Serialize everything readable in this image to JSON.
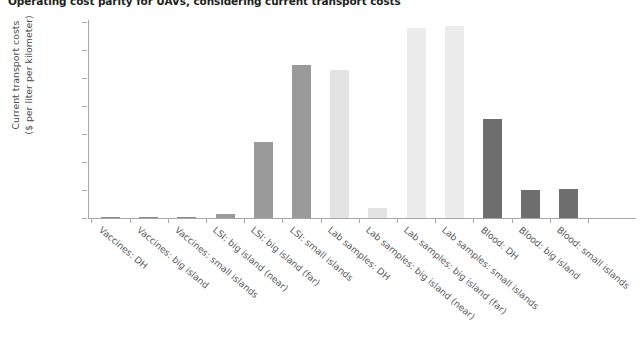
{
  "chart_data": {
    "type": "bar",
    "title": "Operating cost parity for UAVs, considering current transport costs",
    "xlabel": "",
    "ylabel_line1": "Current transport costs",
    "ylabel_line2": "($ per liter per kilometer)",
    "ylim": [
      0,
      0.7
    ],
    "ytick_labels": [
      "0.70",
      "0.60",
      "0.50",
      "0.40",
      "0.30",
      "0.20",
      "0.10",
      "0"
    ],
    "ytick_values": [
      0.7,
      0.6,
      0.5,
      0.4,
      0.3,
      0.2,
      0.1,
      0
    ],
    "grid": false,
    "legend": "none",
    "categories": [
      "Vaccines: DH",
      "Vaccines: big island",
      "Vaccines: small islands",
      "LSI: big island (near)",
      "LSI: big island (far)",
      "LSI: small islands",
      "Lab samples: DH",
      "Lab samples: big island (near)",
      "Lab samples: big island (far)",
      "Lab samples: small islands",
      "Blood: DH",
      "Blood: big island",
      "Blood: small islands"
    ],
    "values": [
      0.002,
      0.005,
      0.004,
      0.015,
      0.27,
      0.545,
      0.53,
      0.035,
      0.68,
      0.685,
      0.355,
      0.1,
      0.105
    ],
    "bar_colors": [
      "#8c8c8c",
      "#8c8c8c",
      "#8c8c8c",
      "#9a9a9a",
      "#9a9a9a",
      "#9a9a9a",
      "#e3e3e3",
      "#e3e3e3",
      "#ececec",
      "#ececec",
      "#6e6e6e",
      "#6e6e6e",
      "#6e6e6e"
    ],
    "groups": [
      {
        "name": "Vaccines",
        "color": "#8c8c8c"
      },
      {
        "name": "LSI",
        "color": "#9a9a9a"
      },
      {
        "name": "Lab samples",
        "color": "#e8e8e8"
      },
      {
        "name": "Blood",
        "color": "#6e6e6e"
      }
    ],
    "axis_color": "#a8a8a8",
    "text_color": "#4c4c4c",
    "background": "#ffffff"
  }
}
